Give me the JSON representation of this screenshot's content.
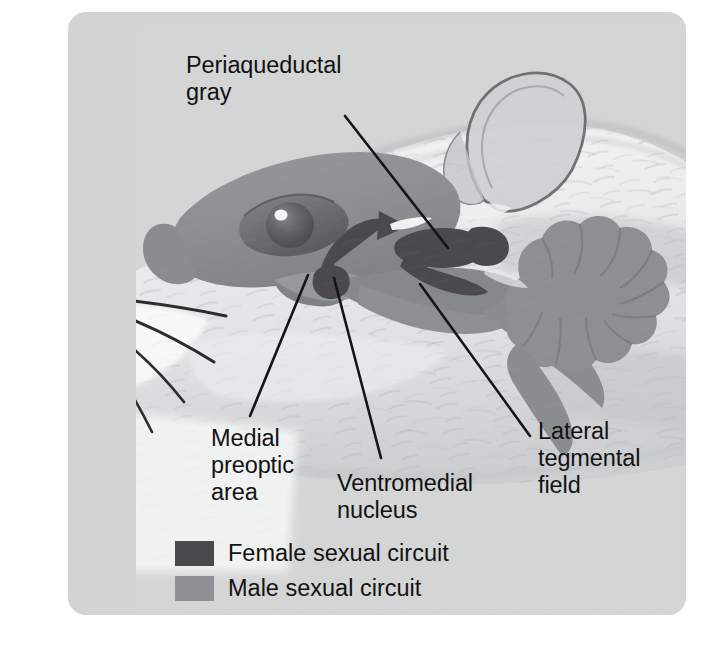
{
  "figure": {
    "kind": "anatomical-diagram",
    "panel_background": "#d4d6d6"
  },
  "colors": {
    "female_circuit": "#4a4a4c",
    "male_circuit": "#8d9092",
    "brain_mass": "#8d9092",
    "panel": "#d4d6d6",
    "leader_line": "#151515",
    "text": "#121212"
  },
  "labels": [
    {
      "id": "periaqueductal-gray",
      "text": "Periaqueductal\ngray",
      "x": 118,
      "y": 40
    },
    {
      "id": "medial-preoptic-area",
      "text": "Medial\npreoptic\narea",
      "x": 143,
      "y": 413
    },
    {
      "id": "ventromedial-nucleus",
      "text": "Ventromedial\nnucleus",
      "x": 269,
      "y": 458
    },
    {
      "id": "lateral-tegmental-field",
      "text": "Lateral\ntegmental\nfield",
      "x": 470,
      "y": 406
    }
  ],
  "legend": {
    "items": [
      {
        "id": "female-sexual-circuit",
        "label": "Female sexual circuit",
        "color": "#4a4a4c",
        "x": 107,
        "y": 528
      },
      {
        "id": "male-sexual-circuit",
        "label": "Male sexual circuit",
        "color": "#8d9092",
        "x": 107,
        "y": 563
      }
    ]
  },
  "leader_lines": [
    {
      "id": "leader-periaqueductal-gray",
      "from": [
        277,
        104
      ],
      "to": [
        380,
        236
      ]
    },
    {
      "id": "leader-medial-preoptic-area",
      "from": [
        240,
        263
      ],
      "to": [
        182,
        404
      ]
    },
    {
      "id": "leader-ventromedial-nucleus",
      "from": [
        266,
        266
      ],
      "to": [
        313,
        446
      ]
    },
    {
      "id": "leader-lateral-tegmental-field",
      "from": [
        352,
        272
      ],
      "to": [
        462,
        424
      ]
    }
  ],
  "structures": [
    {
      "id": "cerebrum-cortex",
      "circuit": "male",
      "description": "large gray cortical mass over the eye"
    },
    {
      "id": "cerebellum",
      "circuit": "male",
      "description": "scalloped cauliflower shaped structure at rear of brain"
    },
    {
      "id": "brainstem",
      "circuit": "male",
      "description": "gray tapering stem toward spinal cord"
    },
    {
      "id": "medial-preoptic-area-region",
      "circuit": "male",
      "description": "light region at front ventral brain"
    },
    {
      "id": "ventromedial-nucleus-region",
      "circuit": "female",
      "description": "small dark round nucleus at ventral hypothalamus"
    },
    {
      "id": "periaqueductal-gray-region",
      "circuit": "female",
      "description": "dark elongated midbrain region"
    },
    {
      "id": "lateral-tegmental-field-region",
      "circuit": "male",
      "description": "gray region of the pons/medulla"
    },
    {
      "id": "circuit-arrow",
      "circuit": "female",
      "description": "curved arrow from ventromedial nucleus to periaqueductal gray"
    }
  ]
}
